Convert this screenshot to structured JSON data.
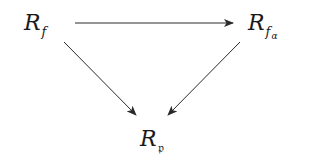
{
  "diagram": {
    "type": "commutative-triangle",
    "nodes": [
      {
        "id": "Rf",
        "base": "R",
        "sub": "f",
        "subsub": ""
      },
      {
        "id": "Rfa",
        "base": "R",
        "sub": "f",
        "subsub": "α"
      },
      {
        "id": "Rp",
        "base": "R",
        "sub": "𝔭",
        "subsub": ""
      }
    ],
    "edges": [
      {
        "from": "Rf",
        "to": "Rfa"
      },
      {
        "from": "Rf",
        "to": "Rp"
      },
      {
        "from": "Rfa",
        "to": "Rp"
      }
    ],
    "colors": {
      "stroke": "#2a2a2a",
      "text": "#1a1a1a",
      "background": "#ffffff"
    }
  }
}
